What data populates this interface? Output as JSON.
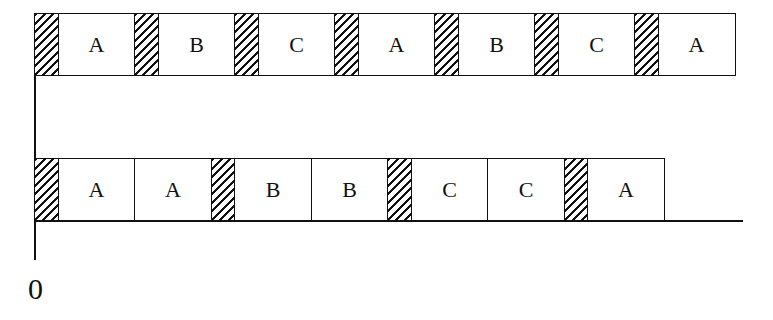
{
  "diagram": {
    "type": "timeline-schedule",
    "origin_label": "0",
    "rows": [
      {
        "name": "top-schedule",
        "segments": [
          {
            "kind": "switch",
            "label": ""
          },
          {
            "kind": "task",
            "label": "A"
          },
          {
            "kind": "switch",
            "label": ""
          },
          {
            "kind": "task",
            "label": "B"
          },
          {
            "kind": "switch",
            "label": ""
          },
          {
            "kind": "task",
            "label": "C"
          },
          {
            "kind": "switch",
            "label": ""
          },
          {
            "kind": "task",
            "label": "A"
          },
          {
            "kind": "switch",
            "label": ""
          },
          {
            "kind": "task",
            "label": "B"
          },
          {
            "kind": "switch",
            "label": ""
          },
          {
            "kind": "task",
            "label": "C"
          },
          {
            "kind": "switch",
            "label": ""
          },
          {
            "kind": "task",
            "label": "A"
          }
        ]
      },
      {
        "name": "bottom-schedule",
        "segments": [
          {
            "kind": "switch",
            "label": ""
          },
          {
            "kind": "task",
            "label": "A"
          },
          {
            "kind": "task",
            "label": "A"
          },
          {
            "kind": "switch",
            "label": ""
          },
          {
            "kind": "task",
            "label": "B"
          },
          {
            "kind": "task",
            "label": "B"
          },
          {
            "kind": "switch",
            "label": ""
          },
          {
            "kind": "task",
            "label": "C"
          },
          {
            "kind": "task",
            "label": "C"
          },
          {
            "kind": "switch",
            "label": ""
          },
          {
            "kind": "task",
            "label": "A"
          }
        ]
      }
    ]
  }
}
